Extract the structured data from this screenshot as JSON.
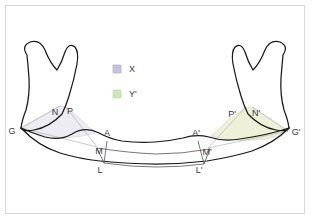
{
  "figure": {
    "title": "",
    "background_color": "#ffffff",
    "frame_color": "#d9d9d9",
    "outline_color": "#1a1a1a"
  },
  "legend": {
    "position": "upper-center",
    "items": [
      {
        "label": "X",
        "swatch_color": "#c3c3e0",
        "swatch_border": "#aaaac8"
      },
      {
        "label": "Y'",
        "swatch_color": "#c9e8b4",
        "swatch_border": "#b3d89c"
      }
    ]
  },
  "regions": [
    {
      "name": "X",
      "fill": "#ececf2",
      "stroke": "#c9c9d6",
      "side": "left",
      "vertices": [
        "G",
        "N",
        "P",
        "M"
      ]
    },
    {
      "name": "Y'",
      "fill": "#eef0d8",
      "stroke": "#d6d8b4",
      "side": "right",
      "vertices": [
        "G'",
        "N'",
        "P'",
        "M'"
      ]
    }
  ],
  "points": [
    {
      "id": "G",
      "label": "G",
      "x": 16,
      "y": 131
    },
    {
      "id": "N",
      "label": "N",
      "x": 55,
      "y": 113
    },
    {
      "id": "P",
      "label": "P",
      "x": 70,
      "y": 112
    },
    {
      "id": "A",
      "label": "A",
      "x": 107,
      "y": 136
    },
    {
      "id": "M",
      "label": "M",
      "x": 99,
      "y": 152
    },
    {
      "id": "L",
      "label": "L",
      "x": 100,
      "y": 170
    },
    {
      "id": "A'",
      "label": "A'",
      "x": 196,
      "y": 136
    },
    {
      "id": "M'",
      "label": "M'",
      "x": 205,
      "y": 153
    },
    {
      "id": "L'",
      "label": "L'",
      "x": 199,
      "y": 170
    },
    {
      "id": "P'",
      "label": "P'",
      "x": 232,
      "y": 115
    },
    {
      "id": "N'",
      "label": "N'",
      "x": 256,
      "y": 114
    },
    {
      "id": "G'",
      "label": "G'",
      "x": 293,
      "y": 134
    }
  ]
}
